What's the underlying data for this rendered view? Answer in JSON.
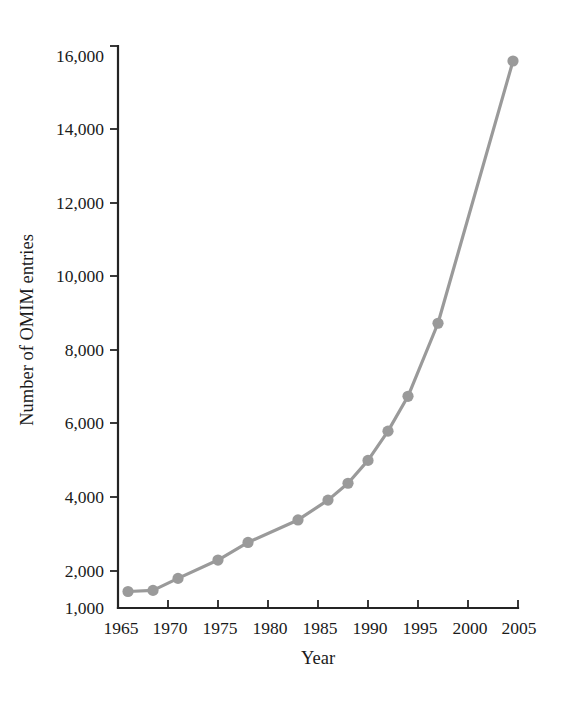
{
  "figure": {
    "background_color": "#ffffff",
    "axis_color": "#242424",
    "text_color": "#1a1a1a"
  },
  "chart_data": {
    "type": "line",
    "title": "",
    "xlabel": "Year",
    "ylabel": "Number of OMIM entries",
    "xlim": [
      1965,
      2005
    ],
    "ylim": [
      1000,
      16000
    ],
    "grid": false,
    "legend": "none",
    "series_color": "#9a9a9a",
    "marker": "circle",
    "x_tick_labels": [
      "1965",
      "1970",
      "1975",
      "1980",
      "1985",
      "1990",
      "1995",
      "2000",
      "2005"
    ],
    "x_ticks": [
      1965,
      1970,
      1975,
      1980,
      1985,
      1990,
      1995,
      2000,
      2005
    ],
    "y_tick_labels": [
      "1,000",
      "2,000",
      "4,000",
      "6,000",
      "8,000",
      "10,000",
      "12,000",
      "14,000",
      "16,000"
    ],
    "y_ticks": [
      1000,
      2000,
      4000,
      6000,
      8000,
      10000,
      12000,
      14000,
      16000
    ],
    "series": [
      {
        "name": "OMIM entries",
        "x": [
          1966,
          1968.5,
          1971,
          1975,
          1978,
          1983,
          1986,
          1988,
          1990,
          1992,
          1994,
          1997,
          2004.5
        ],
        "values": [
          1440,
          1470,
          1790,
          2280,
          2750,
          3350,
          3880,
          4330,
          4940,
          5720,
          6650,
          8600,
          15600
        ]
      }
    ]
  }
}
